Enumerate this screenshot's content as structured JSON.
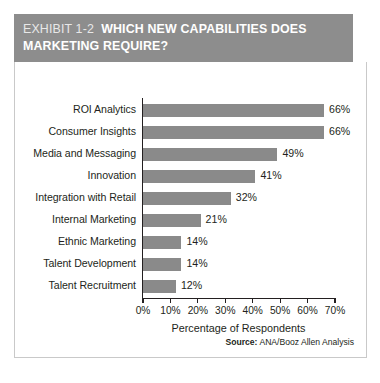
{
  "exhibit": {
    "eyebrow": "EXHIBIT 1-2",
    "title": "WHICH NEW CAPABILITIES DOES MARKETING REQUIRE?",
    "source_key": "Source:",
    "source_value": "ANA/Booz Allen Analysis",
    "band_color": "#8d8d8d",
    "bar_color": "#8a8a8a",
    "text_color": "#231f20"
  },
  "chart_data": {
    "type": "bar",
    "orientation": "horizontal",
    "xlabel": "Percentage of Respondents",
    "ylabel": "",
    "categories": [
      "ROI Analytics",
      "Consumer Insights",
      "Media and Messaging",
      "Innovation",
      "Integration with Retail",
      "Internal Marketing",
      "Ethnic Marketing",
      "Talent Development",
      "Talent Recruitment"
    ],
    "values": [
      66,
      66,
      49,
      41,
      32,
      21,
      14,
      14,
      12
    ],
    "value_labels": [
      "66%",
      "66%",
      "49%",
      "41%",
      "32%",
      "21%",
      "14%",
      "14%",
      "12%"
    ],
    "xlim": [
      0,
      70
    ],
    "xticks": [
      0,
      10,
      20,
      30,
      40,
      50,
      60,
      70
    ],
    "xtick_labels": [
      "0%",
      "10%",
      "20%",
      "30%",
      "40%",
      "50%",
      "60%",
      "70%"
    ],
    "grid": false,
    "legend": null,
    "units": "percent"
  }
}
